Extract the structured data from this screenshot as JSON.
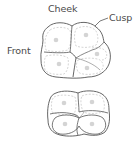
{
  "diagram": {
    "labels": {
      "cheek": "Cheek",
      "cusp": "Cusp",
      "front": "Front"
    },
    "teeth": [
      {
        "name": "upper-molar",
        "cusp_count": 4
      },
      {
        "name": "lower-molar",
        "cusp_count": 4
      }
    ],
    "colors": {
      "outline": "#555555",
      "inner_line": "#9a9a9a",
      "cusp_dot": "#d4d4d4",
      "label_text": "#4a4a4a"
    }
  }
}
